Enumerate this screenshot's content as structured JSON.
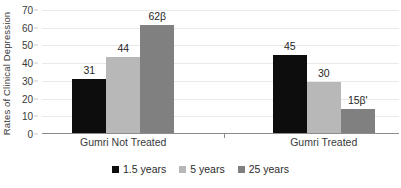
{
  "chart_data": {
    "type": "bar",
    "title": "",
    "subtitle": "",
    "xlabel": "",
    "ylabel": "Rates of Clinical Depression",
    "categories": [
      "Gumri Not Treated",
      "Gumri Treated"
    ],
    "series": [
      {
        "name": "1.5 years",
        "color": "#0d0d0d",
        "values": [
          31,
          45
        ],
        "labels": [
          "31",
          "45"
        ],
        "plotted": [
          30.5,
          44
        ]
      },
      {
        "name": "5 years",
        "color": "#b8b8b8",
        "values": [
          44,
          30
        ],
        "labels": [
          "44",
          "30"
        ],
        "plotted": [
          43,
          29
        ]
      },
      {
        "name": "25 years",
        "color": "#808080",
        "values": [
          62,
          15
        ],
        "labels": [
          "62β",
          "15β'"
        ],
        "plotted": [
          61,
          13.5
        ]
      }
    ],
    "ylim": [
      0,
      70
    ],
    "ytick_step": 10,
    "yticks": [
      "70",
      "60",
      "50",
      "40",
      "30",
      "20",
      "10",
      "0"
    ],
    "grid": true,
    "grid_color": "#e9e9e9",
    "legend_position": "bottom-center",
    "axis_color": "#8c8c8c",
    "background": "#ffffff"
  }
}
